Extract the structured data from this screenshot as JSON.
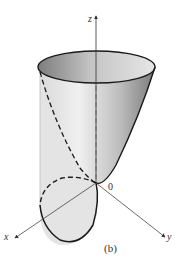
{
  "figure": {
    "caption": "(b)",
    "axes": {
      "x_label": "x",
      "y_label": "y",
      "z_label": "z",
      "origin_label": "0"
    },
    "surfaces": [
      {
        "name": "paraboloid",
        "description": "upward-opening paraboloid with vertex at origin"
      },
      {
        "name": "cylinder",
        "description": "vertical cylinder whose base circle passes through origin in xy-plane"
      }
    ],
    "colors": {
      "stroke": "#1a1a1a",
      "axis": "#444444",
      "cylinder_fill": "#e4e4e4",
      "paraboloid_light": "#f2f2f2",
      "paraboloid_dark": "#8c8c8c"
    }
  }
}
